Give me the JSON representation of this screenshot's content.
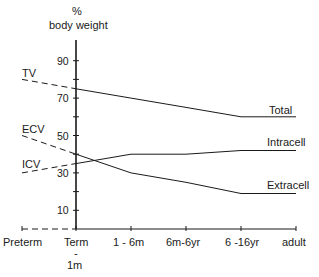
{
  "chart_data": {
    "type": "line",
    "title": "",
    "ylabel_line1": "%",
    "ylabel_line2": "body weight",
    "xlabel": "",
    "categories": [
      "Preterm",
      "Term - 1m",
      "1 - 6m",
      "6m-6yr",
      "6-16yr",
      "adult"
    ],
    "x_tick_labels": [
      "Preterm",
      "Term",
      "-",
      "1m",
      "1 - 6m",
      "6m-6yr",
      "6 -16yr",
      "adult"
    ],
    "y_ticks": [
      10,
      30,
      50,
      70,
      90
    ],
    "y_tick_labels": [
      "10",
      "30",
      "50",
      "70",
      "90"
    ],
    "ylim": [
      0,
      95
    ],
    "series": [
      {
        "name": "Total",
        "label": "Total",
        "preterm_label": "TV",
        "values": [
          80,
          75,
          70,
          65,
          60,
          60
        ]
      },
      {
        "name": "Intracell",
        "label": "Intracell",
        "preterm_label": "ICV",
        "values": [
          30,
          35,
          40,
          40,
          42,
          42
        ]
      },
      {
        "name": "Extracell",
        "label": "Extracell",
        "preterm_label": "ECV",
        "values": [
          50,
          40,
          30,
          25,
          19,
          19
        ]
      }
    ],
    "grid": false,
    "legend_position": "inline-right"
  },
  "labels": {
    "y_pct": "%",
    "y_body": "body weight",
    "tv": "TV",
    "ecv": "ECV",
    "icv": "ICV",
    "total": "Total",
    "intracell": "Intracell",
    "extracell": "Extracell",
    "x0": "Preterm",
    "x1": "Term",
    "x1_dash": "-",
    "x1_sub": "1m",
    "x2": "1 - 6m",
    "x3": "6m-6yr",
    "x4": "6 -16yr",
    "x5": "adult",
    "y10": "10",
    "y30": "30",
    "y50": "50",
    "y70": "70",
    "y90": "90"
  }
}
